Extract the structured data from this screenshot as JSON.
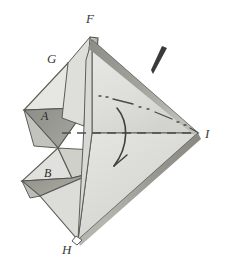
{
  "figure": {
    "background_color": "#ffffff",
    "ink_color": "#4a4a47",
    "width": 225,
    "height": 268
  },
  "vertex_labels": [
    {
      "id": "F",
      "text": "F",
      "x": 86,
      "y": 12
    },
    {
      "id": "G",
      "text": "G",
      "x": 47,
      "y": 52
    },
    {
      "id": "I",
      "text": "I",
      "x": 205,
      "y": 127
    },
    {
      "id": "H",
      "text": "H",
      "x": 62,
      "y": 243
    }
  ],
  "face_labels": [
    {
      "id": "A",
      "text": "A",
      "x": 41,
      "y": 110
    },
    {
      "id": "B",
      "text": "B",
      "x": 44,
      "y": 167
    }
  ],
  "annotations": {
    "tick_mark": "tapered-stroke-mark",
    "rotation_axis": "horizontal-dashed-line",
    "secondary_axis": "dash-dot-line",
    "rotation_arrow": "curved-arrow"
  },
  "palette": {
    "paper": "#ffffff",
    "face_light": "#ebebe8",
    "face_mid": "#dcdcd8",
    "face_medium": "#cdcdc8",
    "face_dark": "#9f9f9a",
    "face_darker": "#8e8e88",
    "edge": "#53534f",
    "shadow_band": "#6f6f6a"
  }
}
